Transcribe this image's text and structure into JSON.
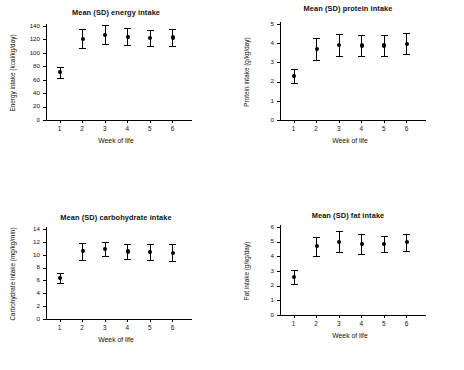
{
  "figure": {
    "panel_count": 4,
    "shared_xlabel": "Week of life",
    "background_color": "#ffffff",
    "marker_color": "#000000"
  },
  "chart_data": [
    {
      "id": "energy",
      "type": "scatter",
      "title": "Mean (SD) energy intake",
      "xlabel": "Week of life",
      "ylabel": "Energy intake (kcal/kg/day)",
      "categories": [
        "1",
        "2",
        "3",
        "4",
        "5",
        "6"
      ],
      "x": [
        1,
        2,
        3,
        4,
        5,
        6
      ],
      "values": [
        71,
        121,
        127,
        124,
        122,
        123
      ],
      "errors": [
        8,
        14,
        14,
        13,
        12,
        13
      ],
      "ylim": [
        0,
        140
      ],
      "yticks": [
        0,
        20,
        40,
        60,
        80,
        100,
        120,
        140
      ],
      "ytick_labels": [
        "0",
        "20",
        "40",
        "60",
        "80",
        "100",
        "120",
        "140"
      ],
      "xlim": [
        0.4,
        6.6
      ],
      "grid": false,
      "legend": false,
      "error_type": "SD"
    },
    {
      "id": "protein",
      "type": "scatter",
      "title": "Mean (SD) protein intake",
      "xlabel": "Week of life",
      "ylabel": "Protein intake (g/kg/day)",
      "categories": [
        "1",
        "2",
        "3",
        "4",
        "5",
        "6"
      ],
      "x": [
        1,
        2,
        3,
        4,
        5,
        6
      ],
      "values": [
        2.3,
        3.7,
        3.9,
        3.88,
        3.88,
        3.97
      ],
      "errors": [
        0.38,
        0.56,
        0.57,
        0.55,
        0.57,
        0.55
      ],
      "ylim": [
        0,
        5
      ],
      "yticks": [
        0,
        1,
        2,
        3,
        4,
        5
      ],
      "ytick_labels": [
        "0",
        "1",
        "2",
        "3",
        "4",
        "5"
      ],
      "xlim": [
        0.4,
        6.6
      ],
      "grid": false,
      "legend": false,
      "error_type": "SD"
    },
    {
      "id": "carbohydrate",
      "type": "scatter",
      "title": "Mean (SD) carbohydrate intake",
      "xlabel": "Week of life",
      "ylabel": "Carbohydrate intake (mg/kg/min)",
      "categories": [
        "1",
        "2",
        "3",
        "4",
        "5",
        "6"
      ],
      "x": [
        1,
        2,
        3,
        4,
        5,
        6
      ],
      "values": [
        6.35,
        10.55,
        10.85,
        10.5,
        10.4,
        10.3
      ],
      "errors": [
        0.75,
        1.35,
        1.1,
        1.15,
        1.25,
        1.3
      ],
      "ylim": [
        0,
        14
      ],
      "yticks": [
        0,
        2,
        4,
        6,
        8,
        10,
        12,
        14
      ],
      "ytick_labels": [
        "0",
        "2",
        "4",
        "6",
        "8",
        "10",
        "12",
        "14"
      ],
      "xlim": [
        0.4,
        6.6
      ],
      "grid": false,
      "legend": false,
      "error_type": "SD"
    },
    {
      "id": "fat",
      "type": "scatter",
      "title": "Mean (SD) fat intake",
      "xlabel": "Week of life",
      "ylabel": "Fat intake (g/kg/day)",
      "categories": [
        "1",
        "2",
        "3",
        "4",
        "5",
        "6"
      ],
      "x": [
        1,
        2,
        3,
        4,
        5,
        6
      ],
      "values": [
        2.6,
        4.68,
        5.0,
        4.85,
        4.85,
        4.95
      ],
      "errors": [
        0.47,
        0.66,
        0.72,
        0.7,
        0.55,
        0.6
      ],
      "ylim": [
        0,
        6
      ],
      "yticks": [
        0,
        1,
        2,
        3,
        4,
        5,
        6
      ],
      "ytick_labels": [
        "0",
        "1",
        "2",
        "3",
        "4",
        "5",
        "6"
      ],
      "xlim": [
        0.4,
        6.6
      ],
      "grid": false,
      "legend": false,
      "error_type": "SD"
    }
  ]
}
